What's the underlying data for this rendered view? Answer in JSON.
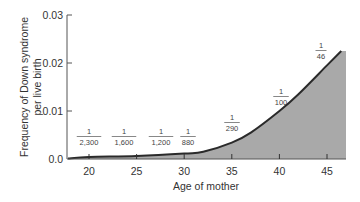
{
  "chart_data": {
    "type": "area",
    "title": "",
    "xlabel": "Age of mother",
    "ylabel": "Frequency of Down syndrome per live birth",
    "ylabel_lines": [
      "Frequency of Down syndrome",
      "per live birth"
    ],
    "xlim": [
      17.5,
      47
    ],
    "ylim": [
      0,
      0.03
    ],
    "x_ticks": [
      20,
      25,
      30,
      35,
      40,
      45
    ],
    "x_tick_labels": [
      "20",
      "25",
      "30",
      "35",
      "40",
      "45"
    ],
    "y_ticks": [
      0,
      0.01,
      0.02,
      0.03
    ],
    "y_tick_labels": [
      "0.0",
      "0.01",
      "0.02",
      "0.03"
    ],
    "grid": false,
    "legend": null,
    "series": [
      {
        "name": "Frequency of Down syndrome",
        "x": [
          17.5,
          20,
          25,
          30,
          32,
          35,
          37,
          40,
          42,
          45,
          46.5
        ],
        "y": [
          0.0001,
          0.00043,
          0.00063,
          0.00114,
          0.0015,
          0.0034,
          0.0055,
          0.01,
          0.0135,
          0.0195,
          0.0225
        ],
        "fill_color": "#a9a9a9",
        "line_color": "#2a2a2a"
      }
    ],
    "annotations": [
      {
        "x": 20,
        "numerator": "1",
        "denominator": "2,300"
      },
      {
        "x": 25,
        "numerator": "1",
        "denominator": "1,600"
      },
      {
        "x": 30,
        "numerator": "1",
        "denominator": "1,200"
      },
      {
        "x": 33,
        "numerator": "1",
        "denominator": "880"
      },
      {
        "x": 35,
        "numerator": "1",
        "denominator": "290"
      },
      {
        "x": 40,
        "numerator": "1",
        "denominator": "100"
      },
      {
        "x": 45,
        "numerator": "1",
        "denominator": "46"
      }
    ]
  }
}
